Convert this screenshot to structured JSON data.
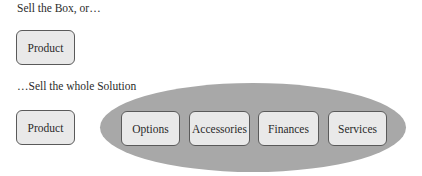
{
  "diagram": {
    "section_box": {
      "caption": "Sell the Box, or…",
      "boxes": [
        {
          "label": "Product"
        }
      ]
    },
    "section_solution": {
      "caption": "…Sell the whole Solution",
      "product_box": {
        "label": "Product"
      },
      "solution_group": {
        "shape": "ellipse",
        "boxes": [
          {
            "label": "Options"
          },
          {
            "label": "Accessories"
          },
          {
            "label": "Finances"
          },
          {
            "label": "Services"
          }
        ]
      }
    },
    "colors": {
      "box_fill": "#e9e9e9",
      "box_border": "#5a5a5a",
      "ellipse_fill": "#a8a8a8",
      "text": "#2a2a2a"
    }
  }
}
